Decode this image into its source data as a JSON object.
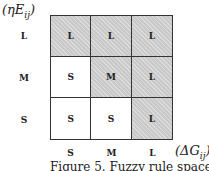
{
  "figure": {
    "y_axis_label": "(ηE_ij)",
    "x_axis_label": "(ΔG_ij)",
    "caption": "Figure 5. Fuzzy rule space",
    "row_labels": [
      "L",
      "M",
      "S"
    ],
    "col_labels": [
      "S",
      "M",
      "L"
    ],
    "shade_color": "#c9c9c9",
    "cells": [
      [
        {
          "label": "L",
          "shaded": true
        },
        {
          "label": "L",
          "shaded": true
        },
        {
          "label": "L",
          "shaded": true
        }
      ],
      [
        {
          "label": "S",
          "shaded": false
        },
        {
          "label": "M",
          "shaded": true
        },
        {
          "label": "L",
          "shaded": true
        }
      ],
      [
        {
          "label": "S",
          "shaded": false
        },
        {
          "label": "S",
          "shaded": false
        },
        {
          "label": "L",
          "shaded": true
        }
      ]
    ]
  }
}
